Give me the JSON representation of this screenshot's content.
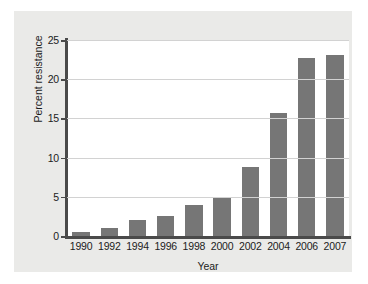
{
  "figure": {
    "panel_background": "#eaeae8",
    "plot_background": "#ffffff",
    "bar_color": "#767676",
    "axis_color": "#4a4a4a",
    "grid_color": "#d2d2d2"
  },
  "chart_data": {
    "type": "bar",
    "title": "",
    "xlabel": "Year",
    "ylabel": "Percent resistance",
    "categories": [
      "1990",
      "1992",
      "1994",
      "1996",
      "1998",
      "2000",
      "2002",
      "2004",
      "2006",
      "2007"
    ],
    "values": [
      0.5,
      1.0,
      2.0,
      2.5,
      4.0,
      5.0,
      8.8,
      15.7,
      22.7,
      23.1
    ],
    "ylim": [
      0,
      25
    ],
    "yticks": [
      0,
      5,
      10,
      15,
      20,
      25
    ],
    "ytick_labels": [
      "0",
      "5",
      "10",
      "15",
      "20",
      "25"
    ],
    "grid": "horizontal",
    "legend": null,
    "series": [
      {
        "name": "Percent resistance",
        "values": [
          0.5,
          1.0,
          2.0,
          2.5,
          4.0,
          5.0,
          8.8,
          15.7,
          22.7,
          23.1
        ]
      }
    ]
  }
}
